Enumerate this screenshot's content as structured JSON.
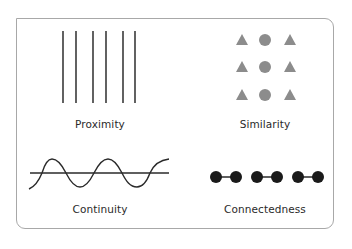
{
  "panels": [
    {
      "id": "proximity",
      "label": "Proximity"
    },
    {
      "id": "similarity",
      "label": "Similarity"
    },
    {
      "id": "continuity",
      "label": "Continuity"
    },
    {
      "id": "connectedness",
      "label": "Connectedness"
    }
  ],
  "colors": {
    "frame": "#a8a8a8",
    "lines": "#3a3a3a",
    "shapes": "#8c8c8c",
    "dots": "#1a1a1a",
    "text": "#2a2a2a"
  }
}
